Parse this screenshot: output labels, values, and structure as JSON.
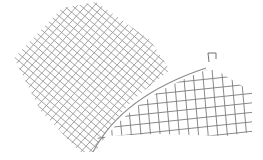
{
  "drawing": {
    "width": 262,
    "height": 159,
    "background": "#ffffff",
    "colors": {
      "diagonal_grid": "#9a9a9a",
      "rect_grid": "#7c7c7c",
      "boundary_curve": "#8a8a8a",
      "bracket_mark": "#707070"
    },
    "diagonal_grid": {
      "description": "Rotated crosshatch grid, upper-left region",
      "spacing": 8.5
    },
    "rect_grid": {
      "description": "Slightly skewed rectilinear grid, lower-right region",
      "vertical_lines": 14,
      "horizontal_lines": 7
    },
    "boundary_curve": {
      "start": [
        93,
        152
      ],
      "end": [
        206,
        68
      ]
    },
    "bracket_mark": {
      "position": [
        208,
        52
      ]
    }
  }
}
